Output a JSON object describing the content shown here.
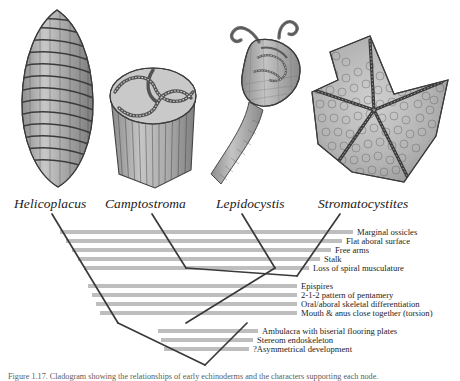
{
  "figure": {
    "caption": "Figure 1.17. Cladogram showing the relationships of early echinoderms and the characters supporting each node.",
    "bar_color": "#b9b9b9",
    "line_color": "#3a3a3a",
    "background": "#ffffff"
  },
  "taxa": [
    {
      "name": "Helicoplacus",
      "x": 14,
      "y": 2,
      "fossil": "helicoplacus-spindle-fossil"
    },
    {
      "name": "Camptostroma",
      "x": 105,
      "y": 2,
      "fossil": "camptostroma-drum-fossil"
    },
    {
      "name": "Lepidocystis",
      "x": 216,
      "y": 2,
      "fossil": "lepidocystis-stalked-fossil"
    },
    {
      "name": "Stromatocystites",
      "x": 318,
      "y": 2,
      "fossil": "stromatocystites-star-fossil"
    }
  ],
  "characters": [
    {
      "label": "Marginal ossicles",
      "group": 1,
      "bar_left": 60,
      "bar_right": 353,
      "y": 34
    },
    {
      "label": "Flat aboral surface",
      "group": 1,
      "bar_left": 66,
      "bar_right": 342,
      "y": 43
    },
    {
      "label": "Free arms",
      "group": 1,
      "bar_left": 72,
      "bar_right": 331,
      "y": 52
    },
    {
      "label": "Stalk",
      "group": 1,
      "bar_left": 78,
      "bar_right": 320,
      "y": 61
    },
    {
      "label": "Loss of spiral musculature",
      "group": 1,
      "bar_left": 84,
      "bar_right": 309,
      "y": 70
    },
    {
      "label": "Epispires",
      "group": 2,
      "bar_left": 88,
      "bar_right": 297,
      "y": 88
    },
    {
      "label": "2-1-2 pattern of pentamery",
      "group": 2,
      "bar_left": 92,
      "bar_right": 297,
      "y": 97
    },
    {
      "label": "Oral/aboral skeletal differentiation",
      "group": 2,
      "bar_left": 96,
      "bar_right": 297,
      "y": 106
    },
    {
      "label": "Mouth & anus close together (torsion)",
      "group": 2,
      "bar_left": 100,
      "bar_right": 297,
      "y": 115
    },
    {
      "label": "Ambulacra with biserial flooring plates",
      "group": 3,
      "bar_left": 158,
      "bar_right": 258,
      "y": 133
    },
    {
      "label": "Stereom endoskeleton",
      "group": 3,
      "bar_left": 161,
      "bar_right": 253,
      "y": 142
    },
    {
      "label": "?Asymmetrical development",
      "group": 3,
      "bar_left": 164,
      "bar_right": 249,
      "y": 151
    }
  ],
  "cladogram": {
    "branches": [
      {
        "name": "helicoplacus-branch",
        "x1": 52,
        "y1": 18,
        "x2": 118,
        "y2": 127
      },
      {
        "name": "camptostroma-branch",
        "x1": 152,
        "y1": 18,
        "x2": 186,
        "y2": 72
      },
      {
        "name": "lepidocystis-branch",
        "x1": 242,
        "y1": 18,
        "x2": 275,
        "y2": 72
      },
      {
        "name": "stromatocystites-branch",
        "x1": 340,
        "y1": 18,
        "x2": 297,
        "y2": 80
      },
      {
        "name": "node-crown-left",
        "x1": 297,
        "y1": 80,
        "x2": 186,
        "y2": 72
      },
      {
        "name": "node-inner-left",
        "x1": 275,
        "y1": 72,
        "x2": 186,
        "y2": 127
      },
      {
        "name": "node-root-left",
        "x1": 205,
        "y1": 169,
        "x2": 118,
        "y2": 127
      },
      {
        "name": "node-root-right",
        "x1": 205,
        "y1": 169,
        "x2": 247,
        "y2": 127
      }
    ]
  }
}
